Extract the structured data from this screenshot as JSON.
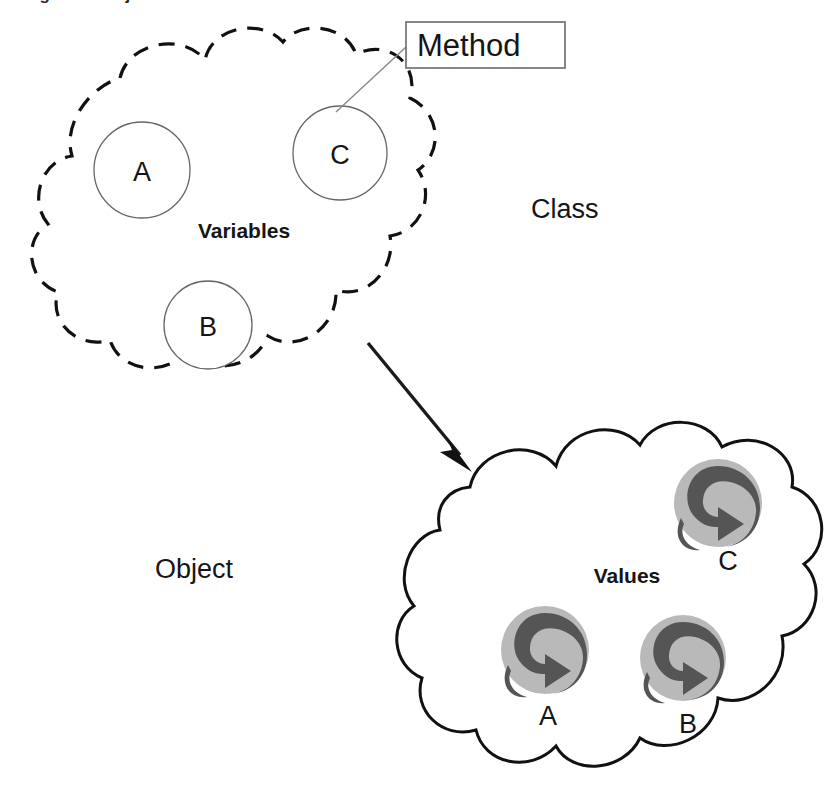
{
  "figure": {
    "caption_fragment": "Figure 1.  Objects and their Values",
    "background_color": "#ffffff"
  },
  "class_region": {
    "label": "Class",
    "cloud_style": "dashed",
    "inner_label": "Variables",
    "callout": {
      "label": "Method",
      "target": "variable-circle-c"
    },
    "variables": [
      {
        "label": "A"
      },
      {
        "label": "C"
      },
      {
        "label": "B"
      }
    ]
  },
  "object_region": {
    "label": "Object",
    "cloud_style": "solid",
    "inner_label": "Values",
    "values": [
      {
        "label": "C",
        "icon": "recycle-icon"
      },
      {
        "label": "A",
        "icon": "recycle-icon"
      },
      {
        "label": "B",
        "icon": "recycle-icon"
      }
    ]
  },
  "connector": {
    "name": "instantiation-arrow",
    "from": "class-cloud",
    "to": "object-cloud",
    "style": "solid-filled-arrowhead"
  },
  "colors": {
    "outline": "#111111",
    "circle_outline": "#666666",
    "leader_line": "#888888",
    "icon_background": "#b9b9b9",
    "icon_arrow": "#555555",
    "text": "#151515"
  }
}
